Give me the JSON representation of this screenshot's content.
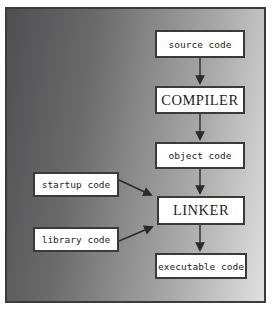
{
  "diagram": {
    "flow_boxes": [
      {
        "id": "source",
        "label": "source code"
      },
      {
        "id": "compiler",
        "label": "COMPILER"
      },
      {
        "id": "object",
        "label": "object code"
      },
      {
        "id": "linker",
        "label": "LINKER"
      },
      {
        "id": "executable",
        "label": "executable code"
      }
    ],
    "input_boxes": [
      {
        "id": "startup",
        "label": "startup code"
      },
      {
        "id": "library",
        "label": "library code"
      }
    ],
    "arrows": [
      {
        "from": "source code",
        "to": "COMPILER"
      },
      {
        "from": "COMPILER",
        "to": "object code"
      },
      {
        "from": "object code",
        "to": "LINKER"
      },
      {
        "from": "startup code",
        "to": "LINKER"
      },
      {
        "from": "library code",
        "to": "LINKER"
      },
      {
        "from": "LINKER",
        "to": "executable code"
      }
    ],
    "colors": {
      "background_gradient_left": "#4f4f51",
      "background_gradient_right": "#e0e0e0",
      "box_fill": "#ffffff",
      "box_border": "#3a3a3a",
      "frame_border": "#3b3b3b",
      "arrow": "#2b2b2b",
      "page_margin": "#ffffff",
      "text": "#1e1e1e"
    }
  }
}
